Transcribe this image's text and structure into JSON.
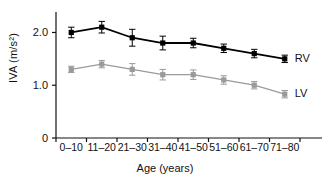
{
  "chart_data": {
    "type": "line",
    "title": "",
    "xlabel": "Age (years)",
    "ylabel": "IVA (m/s²)",
    "categories": [
      "0–10",
      "11–20",
      "21–30",
      "31–40",
      "41–50",
      "51–60",
      "61–70",
      "71–80"
    ],
    "ylim": [
      0,
      2.35
    ],
    "yticks": [
      0,
      1.0,
      2.0
    ],
    "ytick_labels": [
      "0",
      "1.0",
      "2.0"
    ],
    "grid": false,
    "legend_position": "right-inline",
    "series": [
      {
        "name": "RV",
        "color": "#000000",
        "marker": "square",
        "values": [
          2.0,
          2.1,
          1.9,
          1.8,
          1.8,
          1.7,
          1.6,
          1.5
        ],
        "errors": [
          0.1,
          0.11,
          0.16,
          0.13,
          0.09,
          0.08,
          0.08,
          0.07
        ]
      },
      {
        "name": "LV",
        "color": "#9a9a9a",
        "marker": "square",
        "values": [
          1.3,
          1.4,
          1.3,
          1.2,
          1.2,
          1.1,
          1.0,
          0.83
        ],
        "errors": [
          0.06,
          0.07,
          0.11,
          0.1,
          0.09,
          0.08,
          0.07,
          0.07
        ]
      }
    ]
  },
  "legend": {
    "rv_label": "RV",
    "lv_label": "LV"
  },
  "axes": {
    "y_label": "IVA (m/s²)",
    "x_label": "Age (years)",
    "ytick_0": "0",
    "ytick_1": "1.0",
    "ytick_2": "2.0"
  }
}
